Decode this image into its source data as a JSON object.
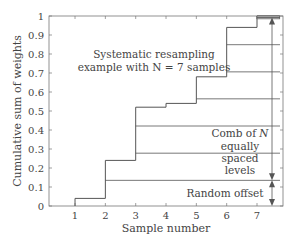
{
  "chart_data": {
    "type": "line",
    "subtype": "step",
    "title": "",
    "xlabel": "Sample number",
    "ylabel": "Cumulative sum of weights",
    "xlim": [
      0.15,
      7.85
    ],
    "ylim": [
      0,
      1
    ],
    "xticks": [
      1,
      2,
      3,
      4,
      5,
      6,
      7
    ],
    "yticks": [
      0,
      0.1,
      0.2,
      0.3,
      0.4,
      0.5,
      0.6,
      0.7,
      0.8,
      0.9,
      1
    ],
    "ytick_labels": [
      "0",
      "0.1",
      "0.2",
      "0.3",
      "0.4",
      "0.5",
      "0.6",
      "0.7",
      "0.8",
      "0.9",
      "1"
    ],
    "grid": false,
    "legend": null,
    "series": [
      {
        "name": "Cumulative sum of weights",
        "x": [
          1,
          2,
          3,
          4,
          5,
          6,
          7
        ],
        "values": [
          0.04,
          0.24,
          0.52,
          0.54,
          0.68,
          0.94,
          1.0
        ]
      }
    ],
    "comb_levels": [
      0.135,
      0.278,
      0.421,
      0.564,
      0.706,
      0.849,
      0.992
    ],
    "random_offset": 0.135,
    "N": 7,
    "annotations": [
      {
        "text": "Systematic resampling",
        "x": 3.6,
        "y": 0.805
      },
      {
        "text": "example with N = 7 samples",
        "x": 3.6,
        "y": 0.745
      },
      {
        "text": "Comb of N",
        "x": 6.55,
        "y": 0.38
      },
      {
        "text": "equally",
        "x": 6.55,
        "y": 0.32
      },
      {
        "text": "spaced",
        "x": 6.55,
        "y": 0.26
      },
      {
        "text": "levels",
        "x": 6.55,
        "y": 0.2
      },
      {
        "text": "Random offset",
        "x": 6.0,
        "y": 0.065
      }
    ]
  },
  "labels": {
    "xlabel": "Sample number",
    "ylabel": "Cumulative sum of weights",
    "annot_line1": "Systematic resampling",
    "annot_line2": "example with N = 7 samples",
    "comb_1": "Comb of ",
    "comb_1_italic": "N",
    "comb_2": "equally",
    "comb_3": "spaced",
    "comb_4": "levels",
    "offset": "Random offset"
  },
  "colors": {
    "line": "#555555",
    "axis": "#777777",
    "text": "#444444",
    "shade": "#bbbbbb"
  }
}
